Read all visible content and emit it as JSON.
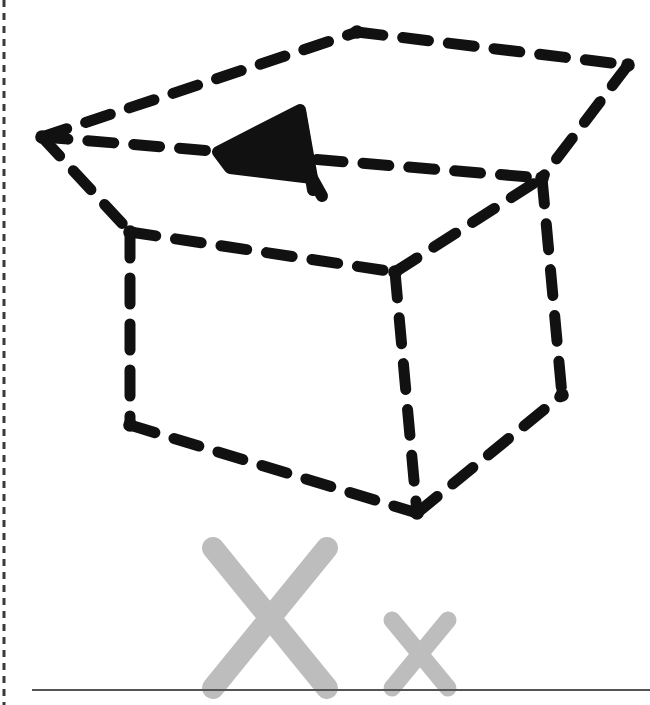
{
  "figure": {
    "title": "Hand-drawn dashed wireframe cube with gray X marks on a baseline",
    "background_color": "#ffffff",
    "stroke_color": "#111111",
    "gray_color": "#bdbdbd",
    "baseline_color": "#555555",
    "margin_rule_color": "#3a3a3a"
  },
  "margin_rule": {
    "name": "left-margin-dashed-rule",
    "x": 4,
    "y1": 0,
    "y2": 705,
    "width": 3,
    "dash": "7 6",
    "color": "#3a3a3a"
  },
  "baseline": {
    "name": "bottom-baseline",
    "x1": 32,
    "x2": 650,
    "y": 690,
    "width": 2,
    "color": "#555555"
  },
  "cube": {
    "style": "dashed",
    "stroke_width": 11,
    "dash": "26 20",
    "color": "#111111",
    "vertices": {
      "top_back": [
        357,
        32
      ],
      "top_right_back": [
        628,
        65
      ],
      "left_top": [
        42,
        137
      ],
      "right_mid": [
        542,
        178
      ],
      "left_mid": [
        130,
        232
      ],
      "center": [
        395,
        272
      ],
      "left_bottom": [
        130,
        425
      ],
      "bottom_center": [
        417,
        513
      ],
      "right_bottom": [
        562,
        395
      ]
    },
    "edges": [
      {
        "name": "top-back-left",
        "from": "left_top",
        "to": "top_back"
      },
      {
        "name": "top-back-right",
        "from": "top_back",
        "to": "top_right_back"
      },
      {
        "name": "top-front-right",
        "from": "top_right_back",
        "to": "right_mid"
      },
      {
        "name": "top-front-left",
        "from": "left_top",
        "to": "right_mid"
      },
      {
        "name": "left-upright",
        "from": "left_top",
        "to": "left_mid"
      },
      {
        "name": "center-upright",
        "from": "center",
        "to": "right_mid"
      },
      {
        "name": "face-top-left",
        "from": "left_mid",
        "to": "center"
      },
      {
        "name": "left-vertical",
        "from": "left_mid",
        "to": "left_bottom"
      },
      {
        "name": "center-vertical",
        "from": "center",
        "to": "bottom_center"
      },
      {
        "name": "right-vertical",
        "from": "right_mid",
        "to": "right_bottom"
      },
      {
        "name": "bottom-front-left",
        "from": "left_bottom",
        "to": "bottom_center"
      },
      {
        "name": "bottom-front-right",
        "from": "bottom_center",
        "to": "right_bottom"
      }
    ]
  },
  "triangle_marker": {
    "name": "solid-triangle-marker",
    "color": "#111111",
    "outline_points": "218,152 300,110 312,178 230,168",
    "stem_from": [
      300,
      112
    ],
    "stem_to": [
      313,
      190
    ],
    "tail_from": [
      312,
      178
    ],
    "tail_to": [
      322,
      196
    ],
    "stroke_width": 12
  },
  "marks": [
    {
      "name": "large-x-mark",
      "label": "X",
      "color": "#bdbdbd",
      "stroke_width": 22,
      "x1": 213,
      "y1": 548,
      "x2": 327,
      "y2": 688,
      "x3": 327,
      "y3": 548,
      "x4": 213,
      "y4": 688
    },
    {
      "name": "small-x-mark",
      "label": "x",
      "color": "#bdbdbd",
      "stroke_width": 17,
      "x1": 392,
      "y1": 620,
      "x2": 448,
      "y2": 688,
      "x3": 448,
      "y3": 620,
      "x4": 392,
      "y4": 688
    }
  ]
}
